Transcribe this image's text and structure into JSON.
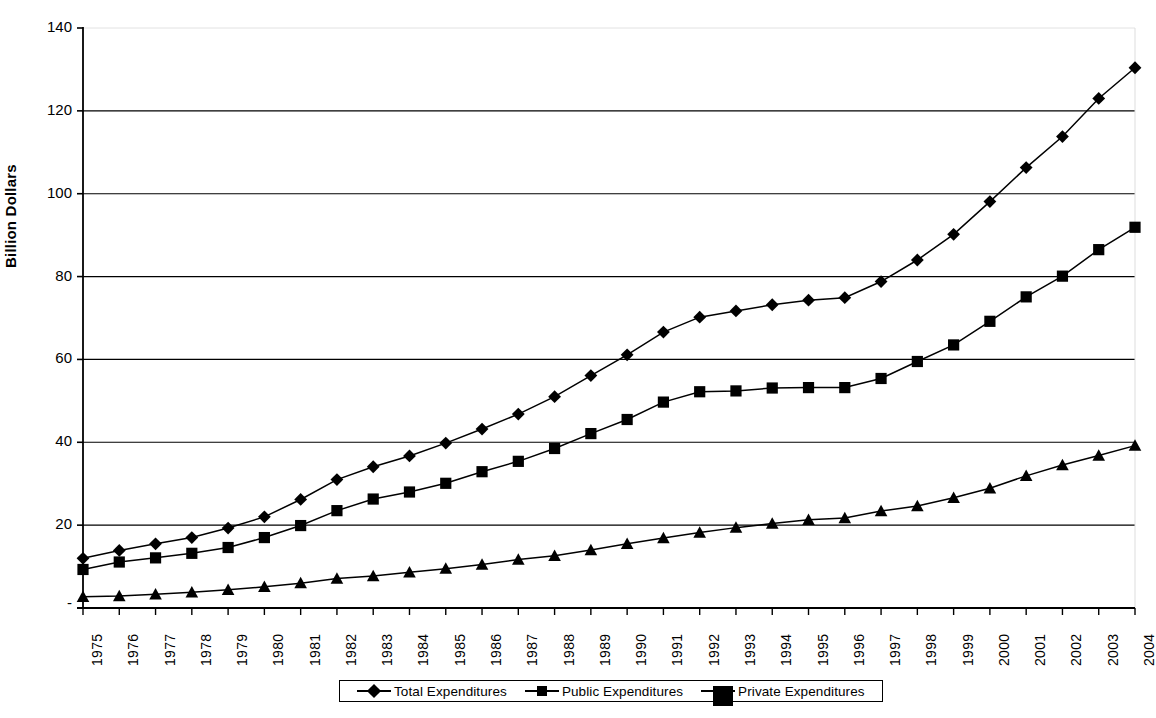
{
  "chart_data": {
    "type": "line",
    "title": "",
    "xlabel": "",
    "ylabel": "Billion Dollars",
    "ylim": [
      0,
      140
    ],
    "ytick_values": [
      0,
      20,
      40,
      60,
      80,
      100,
      120,
      140
    ],
    "ytick_labels": [
      "-",
      "20",
      "40",
      "60",
      "80",
      "100",
      "120",
      "140"
    ],
    "grid": true,
    "grid_axis": "y",
    "legend_position": "bottom",
    "categories": [
      "1975",
      "1976",
      "1977",
      "1978",
      "1979",
      "1980",
      "1981",
      "1982",
      "1983",
      "1984",
      "1985",
      "1986",
      "1987",
      "1988",
      "1989",
      "1990",
      "1991",
      "1992",
      "1993",
      "1994",
      "1995",
      "1996",
      "1997",
      "1998",
      "1999",
      "2000",
      "2001",
      "2002",
      "2003",
      "2004"
    ],
    "series": [
      {
        "name": "Total Expenditures",
        "marker": "diamond",
        "color": "#000000",
        "values": [
          12.0,
          13.9,
          15.5,
          17.0,
          19.3,
          22.0,
          26.2,
          31.0,
          34.1,
          36.7,
          39.8,
          43.2,
          46.8,
          51.0,
          56.1,
          61.1,
          66.6,
          70.2,
          71.7,
          73.2,
          74.3,
          74.9,
          78.8,
          84.0,
          90.2,
          98.1,
          106.3,
          113.8,
          123.0,
          130.4
        ]
      },
      {
        "name": "Public Expenditures",
        "marker": "square",
        "color": "#000000",
        "values": [
          9.3,
          11.1,
          12.1,
          13.2,
          14.6,
          17.0,
          19.9,
          23.5,
          26.3,
          28.0,
          30.1,
          32.9,
          35.4,
          38.5,
          42.1,
          45.5,
          49.7,
          52.2,
          52.4,
          53.1,
          53.2,
          53.2,
          55.4,
          59.5,
          63.5,
          69.2,
          75.1,
          80.1,
          86.5,
          91.9
        ]
      },
      {
        "name": "Private Expenditures",
        "marker": "triangle",
        "color": "#000000",
        "values": [
          2.7,
          2.9,
          3.3,
          3.8,
          4.4,
          5.1,
          6.0,
          7.1,
          7.7,
          8.6,
          9.5,
          10.5,
          11.7,
          12.6,
          14.0,
          15.5,
          16.9,
          18.2,
          19.4,
          20.4,
          21.3,
          21.7,
          23.4,
          24.6,
          26.6,
          28.9,
          31.9,
          34.5,
          36.8,
          39.2
        ]
      }
    ]
  },
  "legend": {
    "items": [
      {
        "label": "Total Expenditures",
        "marker": "diamond"
      },
      {
        "label": "Public Expenditures",
        "marker": "square"
      },
      {
        "label": "Private Expenditures",
        "marker": "triangle"
      }
    ]
  }
}
